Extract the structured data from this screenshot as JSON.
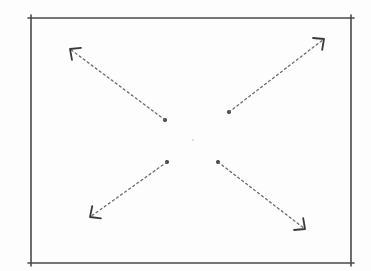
{
  "canvas": {
    "width": 371,
    "height": 271,
    "background": "#fdfdfd"
  },
  "style": {
    "ink_color": "#3a3a3a",
    "frame_color": "#4a4a4a",
    "dotted_color": "#6a6a6a"
  },
  "frame": {
    "x1": 31,
    "y1": 18,
    "x2": 351,
    "y2": 263,
    "corner_tick": 3
  },
  "arrows": [
    {
      "id": "up-left",
      "origin": [
        165,
        120
      ],
      "tip": [
        70,
        49
      ]
    },
    {
      "id": "up-right",
      "origin": [
        229,
        112
      ],
      "tip": [
        324,
        39
      ]
    },
    {
      "id": "down-left",
      "origin": [
        167,
        162
      ],
      "tip": [
        90,
        217
      ]
    },
    {
      "id": "down-right",
      "origin": [
        218,
        162
      ],
      "tip": [
        305,
        229
      ]
    }
  ],
  "center_mark": [
    193,
    140
  ]
}
